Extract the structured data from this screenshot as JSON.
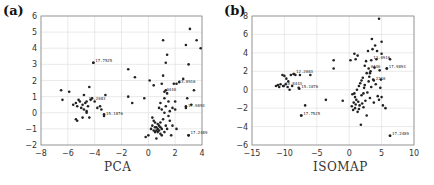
{
  "chart_data": [
    {
      "type": "scatter",
      "panel_label": "(a)",
      "title": "",
      "xlabel": "PCA",
      "ylabel": "",
      "xlim": [
        -8,
        4
      ],
      "ylim": [
        -2,
        6
      ],
      "xticks": [
        "-8",
        "-6",
        "-4",
        "-2",
        "0",
        "2",
        "4"
      ],
      "yticks": [
        "-2",
        "-1",
        "0",
        "1",
        "2",
        "3",
        "4",
        "5",
        "6"
      ],
      "grid": true,
      "annotations": [
        {
          "text": "17.7525",
          "x": -4.1,
          "y": 3.1
        },
        {
          "text": "12.2083",
          "x": -4.6,
          "y": 0.7
        },
        {
          "text": "15.1876",
          "x": -3.3,
          "y": -0.2
        },
        {
          "text": "13.0916",
          "x": 2.1,
          "y": 1.8
        },
        {
          "text": "0440",
          "x": 1.2,
          "y": 1.3
        },
        {
          "text": "17.9893",
          "x": 2.8,
          "y": 0.3
        },
        {
          "text": "17.2489",
          "x": 3.0,
          "y": -1.4
        }
      ],
      "points": [
        [
          -6.5,
          1.4
        ],
        [
          -6.4,
          0.8
        ],
        [
          -5.9,
          1.3
        ],
        [
          -5.4,
          0.6
        ],
        [
          -5.3,
          0.4
        ],
        [
          -5.2,
          0.8
        ],
        [
          -5.1,
          0.7
        ],
        [
          -5.0,
          0.3
        ],
        [
          -4.9,
          0.5
        ],
        [
          -4.8,
          1.1
        ],
        [
          -4.8,
          0.2
        ],
        [
          -4.7,
          0.6
        ],
        [
          -4.6,
          0.0
        ],
        [
          -4.5,
          0.4
        ],
        [
          -4.4,
          1.6
        ],
        [
          -4.3,
          0.8
        ],
        [
          -4.2,
          0.9
        ],
        [
          -4.1,
          3.1
        ],
        [
          -4.0,
          0.7
        ],
        [
          -3.8,
          0.3
        ],
        [
          -3.6,
          0.4
        ],
        [
          -3.5,
          0.2
        ],
        [
          -3.3,
          -0.1
        ],
        [
          -3.2,
          1.1
        ],
        [
          -5.4,
          -0.4
        ],
        [
          -5.3,
          -0.5
        ],
        [
          -4.9,
          -0.3
        ],
        [
          -4.4,
          -0.3
        ],
        [
          -5.6,
          0.5
        ],
        [
          -4.6,
          0.1
        ],
        [
          -1.5,
          2.7
        ],
        [
          -1.5,
          1.0
        ],
        [
          -1.2,
          0.6
        ],
        [
          -1.0,
          2.2
        ],
        [
          -0.3,
          0.9
        ],
        [
          -0.2,
          -1.5
        ],
        [
          0.0,
          -1.4
        ],
        [
          0.1,
          2.0
        ],
        [
          0.2,
          -1.0
        ],
        [
          0.3,
          -0.8
        ],
        [
          0.4,
          1.7
        ],
        [
          0.4,
          -0.5
        ],
        [
          0.5,
          -0.9
        ],
        [
          0.5,
          -1.2
        ],
        [
          0.6,
          -1.1
        ],
        [
          0.6,
          -0.9
        ],
        [
          0.6,
          -1.6
        ],
        [
          0.7,
          -0.7
        ],
        [
          0.7,
          -1.0
        ],
        [
          0.8,
          0.3
        ],
        [
          0.8,
          -1.1
        ],
        [
          0.8,
          -0.8
        ],
        [
          0.9,
          0.6
        ],
        [
          0.9,
          -1.3
        ],
        [
          0.9,
          -0.6
        ],
        [
          1.0,
          1.8
        ],
        [
          1.0,
          -1.0
        ],
        [
          1.0,
          0.2
        ],
        [
          1.1,
          4.5
        ],
        [
          1.1,
          -0.4
        ],
        [
          1.1,
          2.3
        ],
        [
          1.2,
          0.9
        ],
        [
          1.2,
          -1.2
        ],
        [
          1.2,
          0.0
        ],
        [
          1.3,
          3.1
        ],
        [
          1.3,
          1.4
        ],
        [
          1.3,
          -0.8
        ],
        [
          1.3,
          0.4
        ],
        [
          1.4,
          3.6
        ],
        [
          1.4,
          1.2
        ],
        [
          1.4,
          -1.0
        ],
        [
          1.5,
          0.7
        ],
        [
          1.5,
          -0.2
        ],
        [
          1.6,
          0.1
        ],
        [
          1.7,
          -1.4
        ],
        [
          1.8,
          0.3
        ],
        [
          1.8,
          -0.8
        ],
        [
          1.9,
          1.8
        ],
        [
          2.0,
          0.7
        ],
        [
          2.0,
          0.2
        ],
        [
          2.1,
          -1.0
        ],
        [
          2.3,
          1.9
        ],
        [
          2.6,
          2.1
        ],
        [
          2.8,
          4.2
        ],
        [
          2.8,
          0.4
        ],
        [
          2.9,
          0.9
        ],
        [
          3.0,
          3.0
        ],
        [
          3.0,
          -1.4
        ],
        [
          3.1,
          5.2
        ],
        [
          3.2,
          0.5
        ],
        [
          3.4,
          1.4
        ],
        [
          3.6,
          4.5
        ],
        [
          3.9,
          4.0
        ],
        [
          0.4,
          -1.1
        ],
        [
          0.7,
          -1.2
        ],
        [
          0.9,
          -0.9
        ],
        [
          0.5,
          -0.6
        ],
        [
          1.0,
          -1.4
        ],
        [
          1.6,
          -0.5
        ],
        [
          0.3,
          -0.3
        ]
      ]
    },
    {
      "type": "scatter",
      "panel_label": "(b)",
      "title": "",
      "xlabel": "ISOMAP",
      "ylabel": "",
      "xlim": [
        -15,
        10
      ],
      "ylim": [
        -6,
        8
      ],
      "xticks": [
        "-15",
        "-10",
        "-5",
        "0",
        "5",
        "10"
      ],
      "yticks": [
        "-6",
        "-4",
        "-2",
        "0",
        "2",
        "4",
        "6",
        "8"
      ],
      "grid": true,
      "annotations": [
        {
          "text": "12.2083",
          "x": -8.5,
          "y": 1.7
        },
        {
          "text": "10.8443",
          "x": -10.2,
          "y": 0.4
        },
        {
          "text": "15.1876",
          "x": -7.7,
          "y": 0.1
        },
        {
          "text": "17.7525",
          "x": -7.4,
          "y": -2.8
        },
        {
          "text": "13.0916",
          "x": 3.4,
          "y": 3.2
        },
        {
          "text": "17.9893",
          "x": 5.8,
          "y": 2.3
        },
        {
          "text": "17.2489",
          "x": 6.3,
          "y": -5.0
        },
        {
          "text": "0440",
          "x": 3.0,
          "y": 2.3
        },
        {
          "text": "2210",
          "x": 3.8,
          "y": 1.0
        }
      ],
      "points": [
        [
          -11.3,
          0.4
        ],
        [
          -11.0,
          0.5
        ],
        [
          -10.8,
          0.3
        ],
        [
          -10.6,
          0.6
        ],
        [
          -10.3,
          1.6
        ],
        [
          -10.1,
          0.4
        ],
        [
          -10.0,
          1.5
        ],
        [
          -9.8,
          0.6
        ],
        [
          -9.7,
          1.2
        ],
        [
          -9.5,
          0.3
        ],
        [
          -9.4,
          0.9
        ],
        [
          -9.2,
          0.0
        ],
        [
          -9.0,
          1.6
        ],
        [
          -8.8,
          0.4
        ],
        [
          -8.6,
          1.7
        ],
        [
          -8.3,
          1.6
        ],
        [
          -7.8,
          0.2
        ],
        [
          -7.6,
          1.6
        ],
        [
          -7.4,
          -2.8
        ],
        [
          -6.8,
          -1.7
        ],
        [
          -6.0,
          1.6
        ],
        [
          -3.6,
          -1.1
        ],
        [
          -2.4,
          3.2
        ],
        [
          -2.4,
          2.3
        ],
        [
          -1.0,
          -1.2
        ],
        [
          0.2,
          3.2
        ],
        [
          0.4,
          -1.8
        ],
        [
          0.5,
          -0.5
        ],
        [
          0.6,
          -2.2
        ],
        [
          0.7,
          -1.4
        ],
        [
          0.8,
          3.9
        ],
        [
          0.9,
          -0.8
        ],
        [
          1.0,
          3.3
        ],
        [
          1.0,
          -1.6
        ],
        [
          1.1,
          -1.1
        ],
        [
          1.2,
          0.0
        ],
        [
          1.3,
          3.7
        ],
        [
          1.3,
          -2.4
        ],
        [
          1.4,
          -1.3
        ],
        [
          1.5,
          0.4
        ],
        [
          1.6,
          -1.7
        ],
        [
          1.7,
          0.7
        ],
        [
          1.8,
          -3.8
        ],
        [
          1.9,
          -0.6
        ],
        [
          2.0,
          -1.5
        ],
        [
          2.1,
          1.3
        ],
        [
          2.2,
          -1.9
        ],
        [
          2.3,
          0.2
        ],
        [
          2.4,
          2.6
        ],
        [
          2.5,
          -1.2
        ],
        [
          2.6,
          3.1
        ],
        [
          2.7,
          1.8
        ],
        [
          2.7,
          -2.8
        ],
        [
          2.8,
          -0.3
        ],
        [
          2.9,
          4.2
        ],
        [
          3.0,
          0.9
        ],
        [
          3.1,
          1.4
        ],
        [
          3.2,
          -0.9
        ],
        [
          3.3,
          2.0
        ],
        [
          3.4,
          0.3
        ],
        [
          3.5,
          5.5
        ],
        [
          3.6,
          4.4
        ],
        [
          3.7,
          1.1
        ],
        [
          3.8,
          -1.4
        ],
        [
          3.9,
          2.4
        ],
        [
          4.0,
          4.8
        ],
        [
          4.1,
          0.6
        ],
        [
          4.2,
          3.3
        ],
        [
          4.4,
          -0.7
        ],
        [
          4.6,
          7.7
        ],
        [
          4.7,
          2.1
        ],
        [
          4.8,
          0.2
        ],
        [
          5.0,
          3.9
        ],
        [
          5.0,
          5.2
        ],
        [
          5.0,
          -0.8
        ],
        [
          5.2,
          -1.7
        ],
        [
          5.6,
          -2.0
        ],
        [
          5.8,
          2.3
        ],
        [
          6.3,
          3.3
        ],
        [
          6.3,
          -5.0
        ],
        [
          4.3,
          4.2
        ],
        [
          3.2,
          1.8
        ],
        [
          2.4,
          0.5
        ],
        [
          1.9,
          1.0
        ],
        [
          0.9,
          -2.0
        ],
        [
          1.5,
          -2.1
        ],
        [
          2.2,
          -0.4
        ],
        [
          4.6,
          -1.1
        ],
        [
          4.9,
          1.1
        ],
        [
          0.8,
          -0.4
        ]
      ]
    }
  ]
}
